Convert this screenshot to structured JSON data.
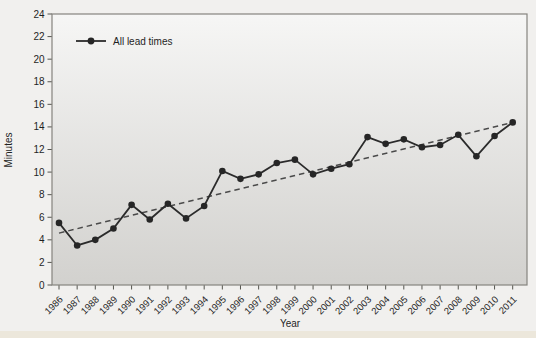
{
  "figure": {
    "background": "#f1f0ee",
    "bottom_strip_color": "#ece7db"
  },
  "chart_data": {
    "type": "line",
    "title": "",
    "xlabel": "Year",
    "ylabel": "Minutes",
    "ylim": [
      0,
      24
    ],
    "ytick_step": 2,
    "grid": false,
    "legend_position": "top-left-inside",
    "legend": [
      {
        "label": "All lead times",
        "marker": "filled-circle"
      }
    ],
    "categories": [
      "1986",
      "1987",
      "1988",
      "1989",
      "1990",
      "1991",
      "1992",
      "1993",
      "1994",
      "1995",
      "1996",
      "1997",
      "1998",
      "1999",
      "2000",
      "2001",
      "2002",
      "2003",
      "2004",
      "2005",
      "2006",
      "2007",
      "2008",
      "2009",
      "2010",
      "2011"
    ],
    "series": [
      {
        "name": "All lead times",
        "values": [
          5.5,
          3.5,
          4.0,
          5.0,
          7.1,
          5.8,
          7.2,
          5.9,
          7.0,
          10.1,
          9.4,
          9.8,
          10.8,
          11.1,
          9.8,
          10.3,
          10.7,
          13.1,
          12.5,
          12.9,
          12.2,
          12.4,
          13.3,
          11.4,
          13.2,
          14.4
        ]
      }
    ],
    "trend_line": {
      "style": "dashed",
      "start_category": "1986",
      "end_category": "2011",
      "start_value": 4.6,
      "end_value": 14.4
    },
    "colors": {
      "line": "#2b2b2b",
      "marker_fill": "#262626",
      "trend": "#4a4a4a",
      "plot_border": "#85847f",
      "plot_bg_top": "#f6f6f5",
      "plot_bg_bottom": "#d2d1ce",
      "text": "#1f1f1f",
      "tick": "#55554f"
    }
  }
}
